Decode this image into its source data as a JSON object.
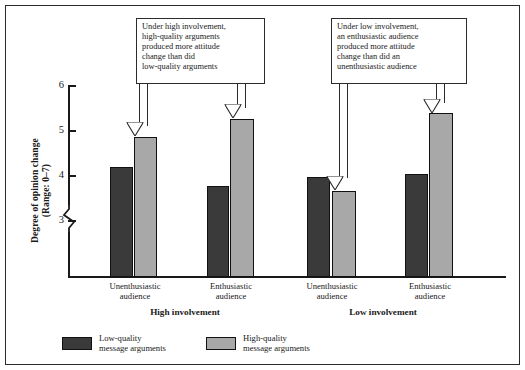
{
  "chart_data": {
    "type": "bar",
    "title": "",
    "xlabel": "",
    "ylabel": "Degree of opinion change (Range: 0–7)",
    "ylim": [
      2.55,
      6.0
    ],
    "yticks": [
      3,
      4,
      5,
      6
    ],
    "ytick_labels": [
      "3",
      "4",
      "5",
      "6"
    ],
    "axis_break": true,
    "grid": false,
    "legend_position": "bottom-left",
    "groups": [
      "High involvement",
      "Low involvement"
    ],
    "categories": [
      "Unenthusiastic audience",
      "Enthusiastic audience",
      "Unenthusiastic audience",
      "Enthusiastic audience"
    ],
    "category_lines": [
      [
        "Unenthusiastic",
        "audience"
      ],
      [
        "Enthusiastic",
        "audience"
      ],
      [
        "Unenthusiastic",
        "audience"
      ],
      [
        "Enthusiastic",
        "audience"
      ]
    ],
    "series": [
      {
        "name": "Low-quality message arguments",
        "color": "#3a3a3a",
        "values": [
          4.18,
          3.75,
          3.95,
          4.02
        ]
      },
      {
        "name": "High-quality message arguments",
        "color": "#a8a8a8",
        "values": [
          4.85,
          5.25,
          3.65,
          5.38
        ]
      }
    ],
    "annotations": [
      {
        "id": "callout-high-involvement",
        "lines": [
          "Under high involvement,",
          "high-quality arguments",
          "produced more attitude",
          "change than did",
          "low-quality arguments"
        ],
        "points_to": [
          "High involvement / Unenthusiastic / High-quality",
          "High involvement / Enthusiastic / High-quality"
        ]
      },
      {
        "id": "callout-low-involvement",
        "lines": [
          "Under low involvement,",
          "an enthusiastic audience",
          "produced more attitude",
          "change than did an",
          "unenthusiastic audience"
        ],
        "points_to": [
          "Low involvement / Unenthusiastic / High-quality",
          "Low involvement / Enthusiastic / High-quality"
        ]
      }
    ]
  },
  "axis": {
    "y_title_line1": "Degree of opinion change",
    "y_title_line2": "(Range: 0–7)",
    "tick6": "6",
    "tick5": "5",
    "tick4": "4",
    "tick3": "3"
  },
  "xlabels": {
    "g1c1_l1": "Unenthusiastic",
    "g1c1_l2": "audience",
    "g1c2_l1": "Enthusiastic",
    "g1c2_l2": "audience",
    "g2c1_l1": "Unenthusiastic",
    "g2c1_l2": "audience",
    "g2c2_l1": "Enthusiastic",
    "g2c2_l2": "audience",
    "group1": "High involvement",
    "group2": "Low involvement"
  },
  "callouts": {
    "left": {
      "l1": "Under high involvement,",
      "l2": "high-quality arguments",
      "l3": "produced more attitude",
      "l4": "change than did",
      "l5": "low-quality arguments"
    },
    "right": {
      "l1": "Under low involvement,",
      "l2": "an enthusiastic audience",
      "l3": "produced more attitude",
      "l4": "change than did an",
      "l5": "unenthusiastic audience"
    }
  },
  "legend": {
    "item1_l1": "Low-quality",
    "item1_l2": "message arguments",
    "item2_l1": "High-quality",
    "item2_l2": "message arguments"
  },
  "colors": {
    "low_quality": "#3a3a3a",
    "high_quality": "#a8a8a8",
    "frame": "#2b2b2b",
    "text": "#1a1a1a"
  }
}
